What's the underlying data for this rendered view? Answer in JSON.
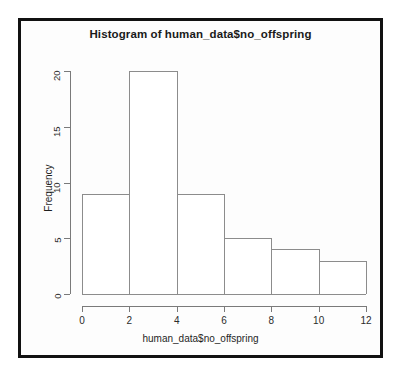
{
  "chart_data": {
    "type": "bar",
    "title": "Histogram of human_data$no_offspring",
    "xlabel": "human_data$no_offspring",
    "ylabel": "Frequency",
    "categories": [
      "0-2",
      "2-4",
      "4-6",
      "6-8",
      "8-10",
      "10-12"
    ],
    "bin_edges": [
      0,
      2,
      4,
      6,
      8,
      10,
      12
    ],
    "values": [
      9,
      20,
      9,
      5,
      4,
      3
    ],
    "xlim": [
      0,
      12
    ],
    "ylim": [
      0,
      20
    ],
    "xticks": [
      "0",
      "2",
      "4",
      "6",
      "8",
      "10",
      "12"
    ],
    "xtick_values": [
      0,
      2,
      4,
      6,
      8,
      10,
      12
    ],
    "yticks": [
      "0",
      "5",
      "10",
      "15",
      "20"
    ],
    "ytick_values": [
      0,
      5,
      10,
      15,
      20
    ],
    "grid": false,
    "legend": false,
    "bar_fill_color": "#ffffff",
    "bar_border_color": "#8c8c8c",
    "axis_color": "#7a7a7a",
    "frame_color": "#111111",
    "background_color": "#ffffff"
  }
}
